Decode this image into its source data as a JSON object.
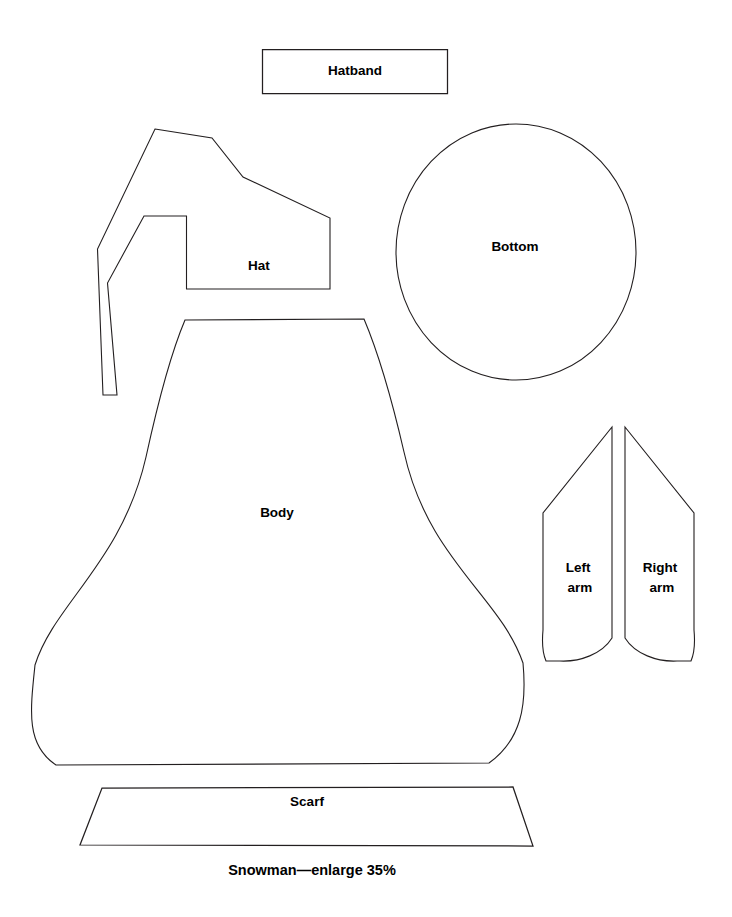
{
  "sheet": {
    "caption": "Snowman—enlarge 35%",
    "background_color": "#ffffff",
    "line_color": "#231f20"
  },
  "pieces": {
    "hatband": {
      "label": "Hatband",
      "shape": "rectangle",
      "label_x": 355,
      "label_y": 71
    },
    "hat": {
      "label": "Hat",
      "shape": "pointed-stocking-cap",
      "label_x": 259,
      "label_y": 266
    },
    "bottom": {
      "label": "Bottom",
      "shape": "circle",
      "label_x": 515,
      "label_y": 247
    },
    "body": {
      "label": "Body",
      "shape": "bell",
      "label_x": 277,
      "label_y": 513
    },
    "left_arm": {
      "label_line1": "Left",
      "label_line2": "arm",
      "shape": "tapered-mitten",
      "label_x": 580,
      "label_y": 576
    },
    "right_arm": {
      "label_line1": "Right",
      "label_line2": "arm",
      "shape": "tapered-mitten",
      "label_x": 662,
      "label_y": 576
    },
    "scarf": {
      "label": "Scarf",
      "shape": "trapezoid",
      "label_x": 307,
      "label_y": 802
    }
  },
  "geometry": {
    "hatband_path": "M 262.5 49.5 L 447.5 49.5 L 447.5 93.5 L 262.5 93.5 Z",
    "hat_path": "M 155 129 L 212 138 L 243 177 L 330 218 L 330 289 L 186.5 289 L 186.5 216 L 144 216 L 107.5 283 L 117 395 L 103 395 L 97.5 249 Z",
    "bottom_cx": 516,
    "bottom_cy": 252,
    "bottom_rx": 120,
    "bottom_ry": 128,
    "body_path": "M 185 320 L 364 319 C 378 352 392 400 404 452 C 428 560 500 596 523 663 C 527 706 521 740 489 763 L 56 765 C 26 745 30 712 35 665 C 54 604 122 562 146 457 C 158 402 171 353 185 320 Z",
    "left_arm_path": "M 612 427 L 612 638 C 602 654 580 662 560 661 L 546 661 C 542 652 542 641 543 630 L 543 513 Z",
    "right_arm_path": "M 625 427 L 694 513 L 694 630 C 695 641 695 652 691 661 L 677 661 C 657 662 635 654 625 638 Z",
    "scarf_path": "M 102 788 L 513 787 L 533 846 L 80 845 Z",
    "caption_x": 312,
    "caption_y": 871
  }
}
